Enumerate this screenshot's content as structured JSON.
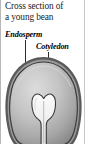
{
  "figure": {
    "title": "Cross section of a young bean",
    "title_line_1": "Cross section of",
    "title_line_2": "a young bean"
  },
  "labels": [
    {
      "id": "endosperm",
      "text": "Endosperm",
      "leader_from_x": 24,
      "leader_from_y": 40,
      "leader_to_y": 85
    },
    {
      "id": "cotyledon",
      "text": "Cotyledon",
      "leader_from_x": 47,
      "leader_from_y": 52,
      "leader_to_y": 100
    }
  ],
  "diagram": {
    "name": "bean-cross-section",
    "outline_color": "#2b2b2b",
    "seed_coat_color": "#6e6e6e",
    "endosperm_fill_light": "#d6d6d6",
    "endosperm_fill_dark": "#8e8e8e",
    "cotyledon_fill": "#f2f2f2",
    "cotyledon_outline": "#3a3a3a",
    "background": "#ffffff"
  }
}
